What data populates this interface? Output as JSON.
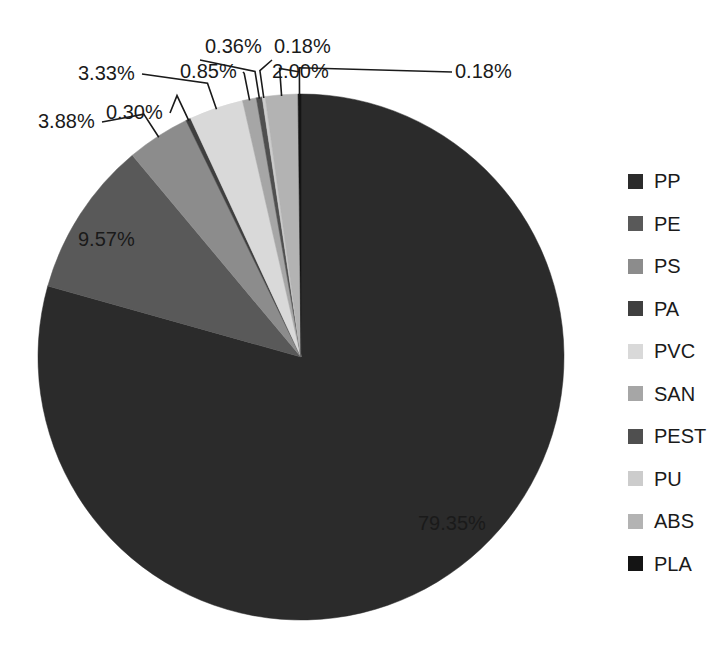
{
  "chart_data": {
    "type": "pie",
    "title": "",
    "categories": [
      "PP",
      "PE",
      "PS",
      "PA",
      "PVC",
      "SAN",
      "PEST",
      "PU",
      "ABS",
      "PLA"
    ],
    "values": [
      79.35,
      9.57,
      3.88,
      0.3,
      3.33,
      0.85,
      0.36,
      0.18,
      2.0,
      0.18
    ],
    "value_labels": [
      "79.35%",
      "9.57%",
      "3.88%",
      "0.30%",
      "3.33%",
      "0.85%",
      "0.36%",
      "0.18%",
      "2.00%",
      "0.18%"
    ],
    "colors": [
      "#2b2b2b",
      "#595959",
      "#8c8c8c",
      "#3f3f3f",
      "#d9d9d9",
      "#a6a6a6",
      "#4f4f4f",
      "#cccccc",
      "#b3b3b3",
      "#141414"
    ],
    "legend_position": "right",
    "start_angle_deg": 0,
    "direction": "clockwise",
    "grid": false,
    "xlabel": "",
    "ylabel": ""
  },
  "legend": {
    "items": [
      {
        "label": "PP",
        "color": "#2b2b2b"
      },
      {
        "label": "PE",
        "color": "#595959"
      },
      {
        "label": "PS",
        "color": "#8c8c8c"
      },
      {
        "label": "PA",
        "color": "#3f3f3f"
      },
      {
        "label": "PVC",
        "color": "#d9d9d9"
      },
      {
        "label": "SAN",
        "color": "#a6a6a6"
      },
      {
        "label": "PEST",
        "color": "#4f4f4f"
      },
      {
        "label": "PU",
        "color": "#cccccc"
      },
      {
        "label": "ABS",
        "color": "#b3b3b3"
      },
      {
        "label": "PLA",
        "color": "#141414"
      }
    ]
  },
  "labels": {
    "pp": "79.35%",
    "pe": "9.57%",
    "ps": "3.88%",
    "pa": "0.30%",
    "pvc": "3.33%",
    "san": "0.85%",
    "pest": "0.36%",
    "pu": "0.18%",
    "abs": "2.00%",
    "pla": "0.18%"
  }
}
